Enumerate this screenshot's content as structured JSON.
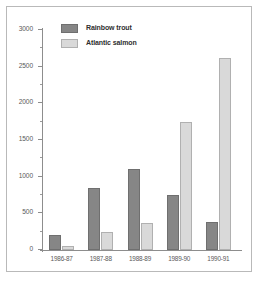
{
  "chart_data": {
    "type": "bar",
    "title": "",
    "subtitle": "",
    "xlabel": "",
    "ylabel": "",
    "categories": [
      "1986-87",
      "1987-88",
      "1988-89",
      "1989-90",
      "1990-91"
    ],
    "series": [
      {
        "name": "Rainbow trout",
        "color": "#868686",
        "values": [
          200,
          850,
          1100,
          750,
          380
        ]
      },
      {
        "name": "Atlantic salmon",
        "color": "#d9d9d9",
        "values": [
          50,
          240,
          370,
          1740,
          2620
        ]
      }
    ],
    "ylim": [
      0,
      3000
    ],
    "ytick_labels": [
      "0",
      "500",
      "1000",
      "1500",
      "2000",
      "2500",
      "3000"
    ],
    "ytick_values": [
      0,
      500,
      1000,
      1500,
      2000,
      2500,
      3000
    ],
    "yminor_interval": 250,
    "grid": false,
    "legend_position": "top-left-inside",
    "axis_color": "#8d8d8d",
    "frame_color": "#b9b9b9",
    "background": "#ffffff"
  },
  "legend": {
    "items": [
      {
        "label": "Rainbow trout",
        "swatch": "trout"
      },
      {
        "label": "Atlantic salmon",
        "swatch": "salmon"
      }
    ]
  }
}
